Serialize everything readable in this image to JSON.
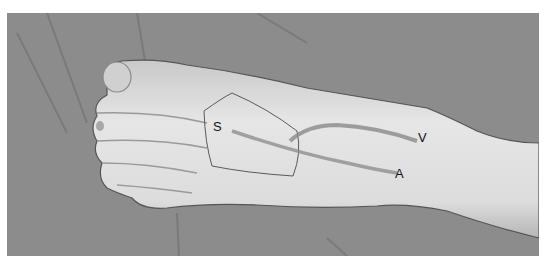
{
  "figure": {
    "labels": [
      {
        "id": "S",
        "text": "S"
      },
      {
        "id": "V",
        "text": "V"
      },
      {
        "id": "A",
        "text": "A"
      }
    ],
    "colors": {
      "background": "#8e8e8e",
      "skin": "#dcdcdc",
      "marking": "#7a7a7a",
      "text": "#111111"
    }
  }
}
